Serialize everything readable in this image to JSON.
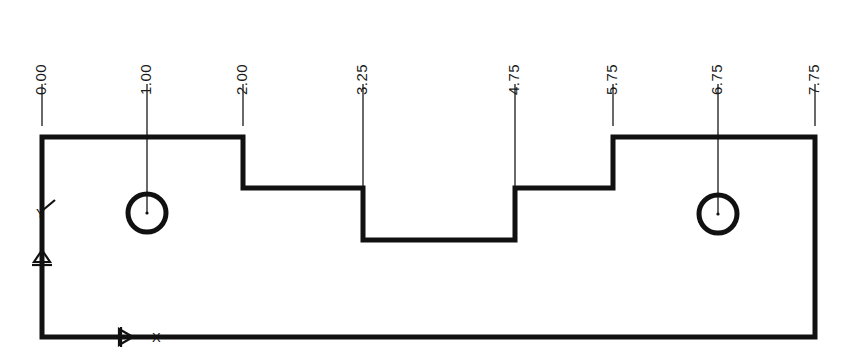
{
  "drawing": {
    "title": "Stepped Plate Profile Dimension Drawing",
    "background_color": "#ffffff",
    "line_color": "#111111",
    "leader_color": "#444444",
    "units_note": "",
    "dimensions": [
      {
        "label": "0.00",
        "x": 42,
        "leader_top": 84,
        "leader_bottom": 126,
        "label_y": 78
      },
      {
        "label": "1.00",
        "x": 147,
        "leader_top": 84,
        "leader_bottom": 214,
        "label_y": 78
      },
      {
        "label": "2.00",
        "x": 243,
        "leader_top": 84,
        "leader_bottom": 126,
        "label_y": 78
      },
      {
        "label": "3.25",
        "x": 363,
        "leader_top": 84,
        "leader_bottom": 186,
        "label_y": 78
      },
      {
        "label": "4.75",
        "x": 515,
        "leader_top": 84,
        "leader_bottom": 186,
        "label_y": 78
      },
      {
        "label": "5.75",
        "x": 613,
        "leader_top": 84,
        "leader_bottom": 126,
        "label_y": 78
      },
      {
        "label": "6.75",
        "x": 718,
        "leader_top": 84,
        "leader_bottom": 214,
        "label_y": 78
      },
      {
        "label": "7.75",
        "x": 815,
        "leader_top": 84,
        "leader_bottom": 126,
        "label_y": 78
      }
    ],
    "profile": {
      "stroke_width": 5,
      "path": "M 42 137 L 243 137 L 243 188 L 363 188 L 363 240 L 515 240 L 515 188 L 613 188 L 613 137 L 815 137 L 815 337 L 42 337 Z",
      "levels": {
        "top_y": 137,
        "mid_y": 188,
        "notch_y": 240,
        "bottom_y": 337
      },
      "left_x": 42,
      "right_x": 815
    },
    "holes": [
      {
        "name": "left-hole",
        "cx": 147,
        "cy": 213,
        "r": 19,
        "stroke_width": 5
      },
      {
        "name": "right-hole",
        "cx": 718,
        "cy": 214,
        "r": 19,
        "stroke_width": 5
      }
    ],
    "datums": {
      "y_axis": {
        "letter": "Y",
        "letter_x": 36,
        "letter_y": 206,
        "marker_x": 42,
        "marker_y": 262
      },
      "x_axis": {
        "letter": "X",
        "letter_x": 152,
        "letter_y": 330,
        "marker_x": 119,
        "marker_y": 337
      }
    }
  }
}
